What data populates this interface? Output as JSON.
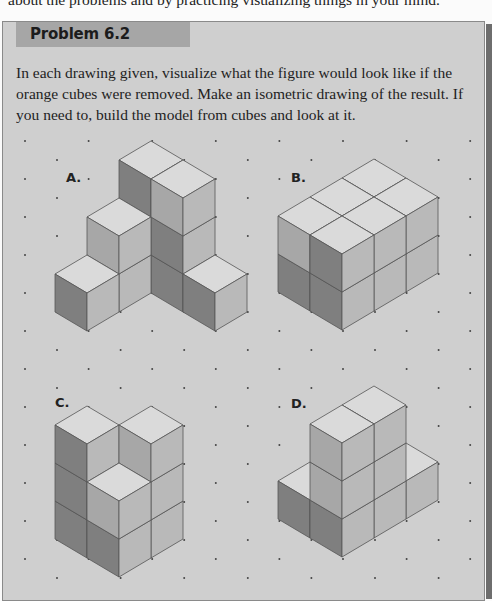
{
  "intro_line": "about the problems and by practicing visualizing things in your mind.",
  "problem": {
    "title": "Problem 6.2",
    "description": "In each drawing given, visualize what the figure would look like if the orange cubes were removed. Make an isometric drawing of the result. If you need to, build the model from cubes and look at it."
  },
  "colors": {
    "panel": "#cfcfcf",
    "tab": "#a6a6a6",
    "top_face": "#dadada",
    "right_face": "#b9b9b9",
    "left_face": "#a7a7a7",
    "orange_face": "#7f7f7f",
    "edge": "#555555",
    "dot": "#444444"
  },
  "figures": [
    {
      "label": "A.",
      "columns": [
        {
          "i": 0,
          "j": 0,
          "h": 3
        },
        {
          "i": 0,
          "j": 1,
          "h": 3
        },
        {
          "i": 0,
          "j": 2,
          "h": 1
        },
        {
          "i": 1,
          "j": 0,
          "h": 2
        },
        {
          "i": 2,
          "j": 0,
          "h": 1
        }
      ],
      "orange": [
        [
          0,
          0,
          2
        ],
        [
          0,
          1,
          1
        ],
        [
          0,
          1,
          0
        ],
        [
          2,
          0,
          0
        ],
        [
          0,
          2,
          0
        ]
      ]
    },
    {
      "label": "B.",
      "columns": [
        {
          "i": 0,
          "j": 0,
          "h": 2
        },
        {
          "i": 0,
          "j": 1,
          "h": 2
        },
        {
          "i": 1,
          "j": 0,
          "h": 2
        },
        {
          "i": 1,
          "j": 1,
          "h": 2
        },
        {
          "i": 2,
          "j": 0,
          "h": 2
        },
        {
          "i": 2,
          "j": 1,
          "h": 2
        }
      ],
      "orange": [
        [
          2,
          1,
          1
        ],
        [
          2,
          0,
          0
        ],
        [
          2,
          1,
          0
        ]
      ]
    },
    {
      "label": "C.",
      "columns": [
        {
          "i": 0,
          "j": 0,
          "h": 2
        },
        {
          "i": 1,
          "j": 0,
          "h": 3
        },
        {
          "i": 0,
          "j": 1,
          "h": 3
        },
        {
          "i": 1,
          "j": 1,
          "h": 2
        }
      ],
      "orange": [
        [
          1,
          0,
          2
        ],
        [
          1,
          0,
          1
        ],
        [
          1,
          0,
          0
        ],
        [
          1,
          1,
          0
        ]
      ]
    },
    {
      "label": "D.",
      "columns": [
        {
          "i": 0,
          "j": 0,
          "h": 1
        },
        {
          "i": 0,
          "j": 1,
          "h": 1
        },
        {
          "i": 1,
          "j": 0,
          "h": 1
        },
        {
          "i": 1,
          "j": 1,
          "h": 3
        },
        {
          "i": 2,
          "j": 0,
          "h": 1
        },
        {
          "i": 2,
          "j": 1,
          "h": 3
        }
      ],
      "orange": [
        [
          2,
          0,
          0
        ],
        [
          2,
          1,
          0
        ]
      ]
    }
  ]
}
